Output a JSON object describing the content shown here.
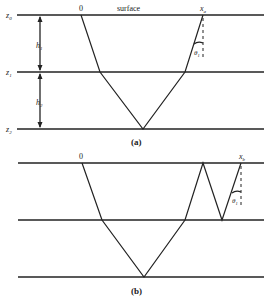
{
  "panel_a": {
    "caption": "(a)",
    "surface_label": "surface",
    "origin_label": "0",
    "receiver_label": "x",
    "receiver_sub": "a",
    "angle_label": "θ",
    "angle_sub": "1",
    "depth_labels": [
      {
        "main": "z",
        "sub": "0"
      },
      {
        "main": "z",
        "sub": "1"
      },
      {
        "main": "z",
        "sub": "2"
      }
    ],
    "thickness_labels": [
      {
        "main": "h",
        "sub": "1"
      },
      {
        "main": "h",
        "sub": "2"
      }
    ]
  },
  "panel_b": {
    "caption": "(b)",
    "origin_label": "0",
    "receiver_label": "x",
    "receiver_sub": "b",
    "angle_label": "θ",
    "angle_sub": "1"
  }
}
